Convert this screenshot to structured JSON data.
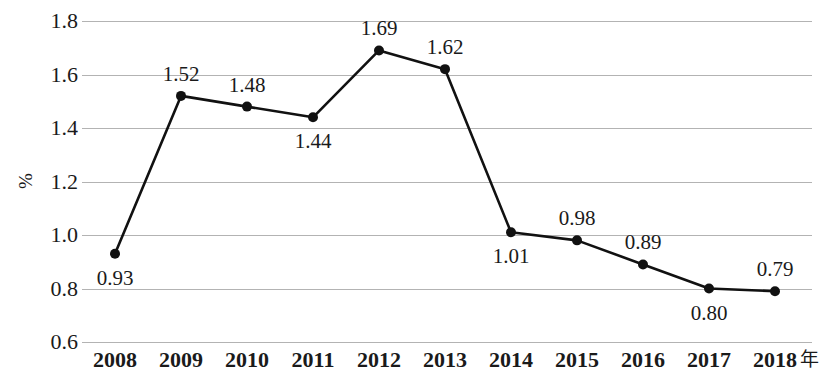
{
  "chart_data": {
    "type": "line",
    "title": "",
    "xlabel": "年",
    "ylabel": "%",
    "ylim": [
      0.6,
      1.8
    ],
    "ytick_step": 0.2,
    "grid": true,
    "legend": "none",
    "categories": [
      "2008",
      "2009",
      "2010",
      "2011",
      "2012",
      "2013",
      "2014",
      "2015",
      "2016",
      "2017",
      "2018"
    ],
    "values": [
      0.93,
      1.52,
      1.48,
      1.44,
      1.69,
      1.62,
      1.01,
      0.98,
      0.89,
      0.8,
      0.79
    ],
    "point_labels": [
      "0.93",
      "1.52",
      "1.48",
      "1.44",
      "1.69",
      "1.62",
      "1.01",
      "0.98",
      "0.89",
      "0.80",
      "0.79"
    ],
    "label_positions": [
      "below",
      "above",
      "above",
      "below",
      "above",
      "above",
      "below",
      "above",
      "above",
      "below",
      "above"
    ],
    "ytick_labels": [
      "1.8",
      "1.6",
      "1.4",
      "1.2",
      "1.0",
      "0.8",
      "0.6"
    ],
    "ytick_values": [
      1.8,
      1.6,
      1.4,
      1.2,
      1.0,
      0.8,
      0.6
    ],
    "series_color": "#111111",
    "grid_color": "#b3b3b3",
    "marker": "filled-circle"
  }
}
